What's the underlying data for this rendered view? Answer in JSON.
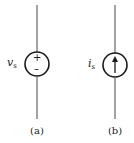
{
  "diagram": {
    "type": "circuit-symbols",
    "colors": {
      "stroke": "#1a1a1a",
      "wire": "#555555"
    },
    "sources": [
      {
        "id": "a",
        "kind": "independent-voltage-source",
        "symbol": "v",
        "subscript": "s",
        "polarity_top": "+",
        "polarity_bottom": "–",
        "caption": "(a)"
      },
      {
        "id": "b",
        "kind": "independent-current-source",
        "symbol": "i",
        "subscript": "s",
        "arrow_direction": "up",
        "caption": "(b)"
      }
    ]
  }
}
